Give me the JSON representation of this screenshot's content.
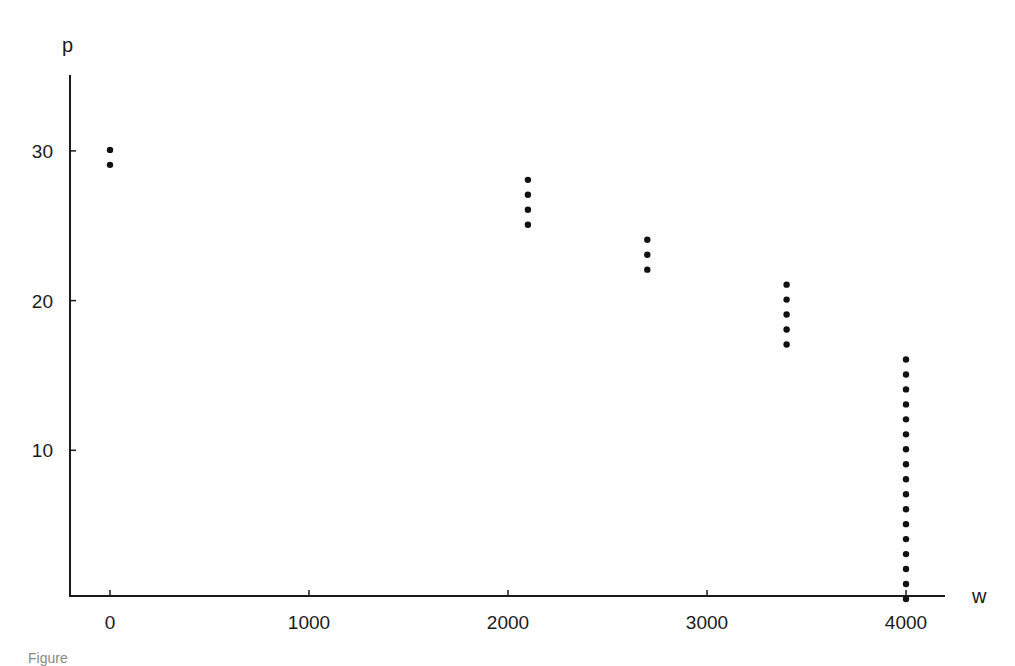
{
  "chart_data": {
    "type": "scatter",
    "title": "",
    "xlabel": "w",
    "ylabel": "p",
    "xlim": [
      -200,
      4200
    ],
    "ylim": [
      0,
      35
    ],
    "xticks": [
      0,
      1000,
      2000,
      3000,
      4000
    ],
    "xtick_labels": [
      "0",
      "1000",
      "2000",
      "3000",
      "4000"
    ],
    "yticks": [
      10,
      20,
      30
    ],
    "ytick_labels": [
      "10",
      "20",
      "30"
    ],
    "grid": false,
    "legend": null,
    "series": [
      {
        "name": "points",
        "color": "#111111",
        "points": [
          [
            0,
            30
          ],
          [
            0,
            29
          ],
          [
            2100,
            28
          ],
          [
            2100,
            27
          ],
          [
            2100,
            26
          ],
          [
            2100,
            25
          ],
          [
            2700,
            24
          ],
          [
            2700,
            23
          ],
          [
            2700,
            22
          ],
          [
            3400,
            21
          ],
          [
            3400,
            20
          ],
          [
            3400,
            19
          ],
          [
            3400,
            18
          ],
          [
            3400,
            17
          ],
          [
            4000,
            16
          ],
          [
            4000,
            15
          ],
          [
            4000,
            14
          ],
          [
            4000,
            13
          ],
          [
            4000,
            12
          ],
          [
            4000,
            11
          ],
          [
            4000,
            10
          ],
          [
            4000,
            9
          ],
          [
            4000,
            8
          ],
          [
            4000,
            7
          ],
          [
            4000,
            6
          ],
          [
            4000,
            5
          ],
          [
            4000,
            4
          ],
          [
            4000,
            3
          ],
          [
            4000,
            2
          ],
          [
            4000,
            1
          ],
          [
            4000,
            0
          ]
        ]
      }
    ]
  },
  "caption": "Figure"
}
